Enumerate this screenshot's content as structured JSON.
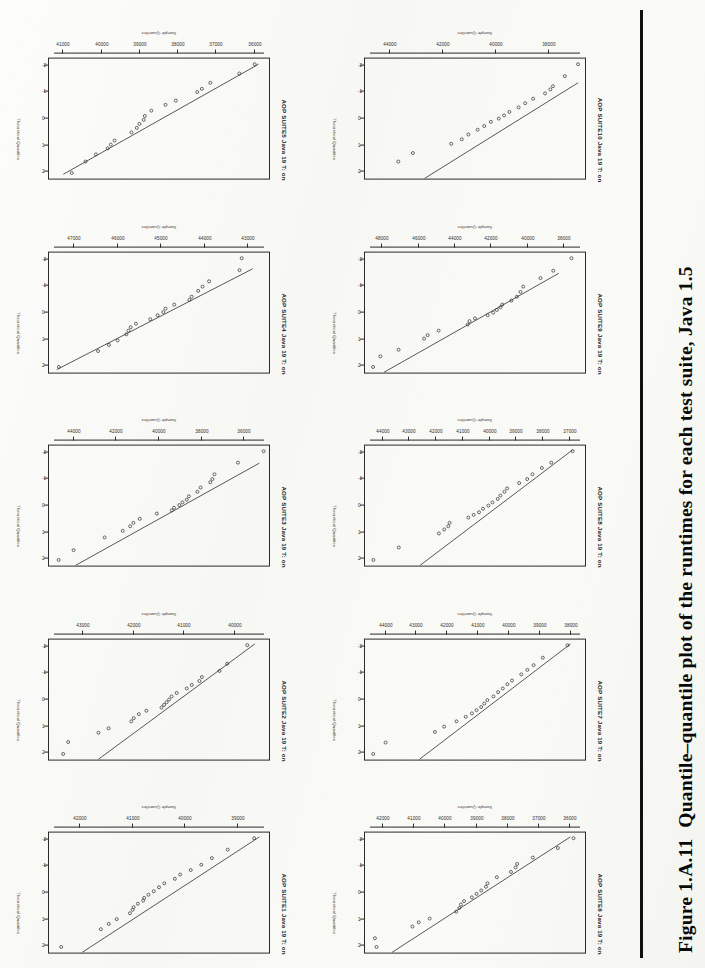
{
  "document": {
    "type": "scanned-book-figure-page",
    "orientation": "rotated-90",
    "caption_label": "Figure 1.A.11",
    "caption_text": "Quantile–quantile plot of the runtimes for each test suite, Java 1.5"
  },
  "axes": {
    "x_label": "Sample Quantiles",
    "y_label": "Theoretical Quantiles",
    "y_ticks": [
      "2",
      "1",
      "0",
      "-1",
      "-2"
    ],
    "y_values": [
      2,
      1,
      0,
      -1,
      -2
    ],
    "ylim": [
      -2.3,
      2.3
    ]
  },
  "chart_data": [
    {
      "type": "scatter",
      "title": "AOP SUITE5 Java 19 T: on",
      "xlabel": "Sample Quantiles",
      "ylabel": "Theoretical Quantiles",
      "xticks": [
        "41000",
        "40000",
        "39000",
        "38000",
        "37000",
        "36000"
      ],
      "xlim": [
        35600,
        41400
      ],
      "ylim": [
        -2.3,
        2.3
      ],
      "grid": false,
      "refline": {
        "x1": 41000,
        "y1": 2.1,
        "x2": 35900,
        "y2": -2.05
      },
      "points": [
        {
          "x": 40780,
          "y": 2.05
        },
        {
          "x": 40420,
          "y": 1.62
        },
        {
          "x": 40150,
          "y": 1.35
        },
        {
          "x": 39840,
          "y": 1.12
        },
        {
          "x": 39760,
          "y": 0.98
        },
        {
          "x": 39660,
          "y": 0.83
        },
        {
          "x": 39220,
          "y": 0.52
        },
        {
          "x": 39080,
          "y": 0.35
        },
        {
          "x": 39010,
          "y": 0.2
        },
        {
          "x": 38900,
          "y": 0.05
        },
        {
          "x": 38870,
          "y": -0.1
        },
        {
          "x": 38700,
          "y": -0.3
        },
        {
          "x": 38330,
          "y": -0.52
        },
        {
          "x": 38060,
          "y": -0.68
        },
        {
          "x": 37500,
          "y": -1.0
        },
        {
          "x": 37380,
          "y": -1.12
        },
        {
          "x": 37160,
          "y": -1.35
        },
        {
          "x": 36400,
          "y": -1.7
        },
        {
          "x": 36000,
          "y": -2.05
        }
      ]
    },
    {
      "type": "scatter",
      "title": "AOP SUITE10 Java 19 T: on",
      "xlabel": "Sample Quantiles",
      "ylabel": "Theoretical Quantiles",
      "xticks": [
        "44000",
        "42000",
        "40000",
        "38000"
      ],
      "xlim": [
        36600,
        45000
      ],
      "ylim": [
        -2.3,
        2.3
      ],
      "grid": false,
      "refline": {
        "x1": 42700,
        "y1": 2.25,
        "x2": 36900,
        "y2": -1.35
      },
      "points": [
        {
          "x": 43700,
          "y": 1.62
        },
        {
          "x": 43150,
          "y": 1.3
        },
        {
          "x": 41700,
          "y": 0.95
        },
        {
          "x": 41300,
          "y": 0.78
        },
        {
          "x": 41050,
          "y": 0.6
        },
        {
          "x": 40700,
          "y": 0.42
        },
        {
          "x": 40450,
          "y": 0.28
        },
        {
          "x": 40200,
          "y": 0.12
        },
        {
          "x": 39900,
          "y": 0.0
        },
        {
          "x": 39700,
          "y": -0.12
        },
        {
          "x": 39500,
          "y": -0.25
        },
        {
          "x": 39150,
          "y": -0.42
        },
        {
          "x": 38900,
          "y": -0.58
        },
        {
          "x": 38600,
          "y": -0.75
        },
        {
          "x": 38150,
          "y": -0.95
        },
        {
          "x": 37950,
          "y": -1.1
        },
        {
          "x": 37850,
          "y": -1.22
        },
        {
          "x": 37400,
          "y": -1.6
        },
        {
          "x": 36900,
          "y": -2.05
        }
      ]
    },
    {
      "type": "scatter",
      "title": "AOP SUITE4 Java 19 T: on",
      "xlabel": "Sample Quantiles",
      "ylabel": "Theoretical Quantiles",
      "xticks": [
        "47000",
        "46000",
        "45000",
        "44000",
        "43000"
      ],
      "xlim": [
        42500,
        47600
      ],
      "ylim": [
        -2.3,
        2.3
      ],
      "grid": false,
      "refline": {
        "x1": 47400,
        "y1": 2.15,
        "x2": 42900,
        "y2": -1.65
      },
      "points": [
        {
          "x": 47350,
          "y": 2.05
        },
        {
          "x": 46450,
          "y": 1.45
        },
        {
          "x": 46200,
          "y": 1.22
        },
        {
          "x": 46000,
          "y": 1.05
        },
        {
          "x": 45800,
          "y": 0.82
        },
        {
          "x": 45750,
          "y": 0.68
        },
        {
          "x": 45700,
          "y": 0.55
        },
        {
          "x": 45580,
          "y": 0.42
        },
        {
          "x": 45250,
          "y": 0.25
        },
        {
          "x": 45080,
          "y": 0.1
        },
        {
          "x": 44950,
          "y": -0.02
        },
        {
          "x": 44900,
          "y": -0.15
        },
        {
          "x": 44700,
          "y": -0.3
        },
        {
          "x": 44350,
          "y": -0.48
        },
        {
          "x": 44300,
          "y": -0.6
        },
        {
          "x": 44150,
          "y": -0.82
        },
        {
          "x": 44050,
          "y": -0.98
        },
        {
          "x": 43900,
          "y": -1.18
        },
        {
          "x": 43200,
          "y": -1.6
        },
        {
          "x": 43150,
          "y": -2.05
        }
      ]
    },
    {
      "type": "scatter",
      "title": "AOP SUITE9 Java 19 T: on",
      "xlabel": "Sample Quantiles",
      "ylabel": "Theoretical Quantiles",
      "xticks": [
        "48000",
        "46000",
        "44000",
        "42000",
        "40000",
        "38000"
      ],
      "xlim": [
        36800,
        49000
      ],
      "ylim": [
        -2.3,
        2.3
      ],
      "grid": false,
      "refline": {
        "x1": 47900,
        "y1": 2.25,
        "x2": 38300,
        "y2": -1.48
      },
      "points": [
        {
          "x": 48500,
          "y": 2.05
        },
        {
          "x": 48100,
          "y": 1.65
        },
        {
          "x": 47100,
          "y": 1.4
        },
        {
          "x": 45700,
          "y": 0.98
        },
        {
          "x": 45500,
          "y": 0.85
        },
        {
          "x": 44900,
          "y": 0.68
        },
        {
          "x": 43300,
          "y": 0.45
        },
        {
          "x": 43200,
          "y": 0.32
        },
        {
          "x": 42900,
          "y": 0.22
        },
        {
          "x": 42200,
          "y": 0.1
        },
        {
          "x": 41900,
          "y": 0.0
        },
        {
          "x": 41700,
          "y": -0.1
        },
        {
          "x": 41500,
          "y": -0.2
        },
        {
          "x": 41400,
          "y": -0.3
        },
        {
          "x": 40900,
          "y": -0.45
        },
        {
          "x": 40600,
          "y": -0.6
        },
        {
          "x": 40400,
          "y": -0.78
        },
        {
          "x": 40250,
          "y": -0.98
        },
        {
          "x": 39300,
          "y": -1.3
        },
        {
          "x": 38600,
          "y": -1.58
        },
        {
          "x": 37600,
          "y": -2.05
        }
      ]
    },
    {
      "type": "scatter",
      "title": "AOP SUITE3 Java 19 T: on",
      "xlabel": "Sample Quantiles",
      "ylabel": "Theoretical Quantiles",
      "xticks": [
        "44000",
        "42000",
        "40000",
        "38000",
        "36000"
      ],
      "xlim": [
        34800,
        45200
      ],
      "ylim": [
        -2.3,
        2.3
      ],
      "grid": false,
      "refline": {
        "x1": 43900,
        "y1": 2.25,
        "x2": 35300,
        "y2": -1.6
      },
      "points": [
        {
          "x": 44700,
          "y": 2.05
        },
        {
          "x": 44000,
          "y": 1.68
        },
        {
          "x": 42550,
          "y": 1.2
        },
        {
          "x": 41700,
          "y": 0.95
        },
        {
          "x": 41350,
          "y": 0.78
        },
        {
          "x": 41200,
          "y": 0.65
        },
        {
          "x": 40900,
          "y": 0.5
        },
        {
          "x": 40100,
          "y": 0.3
        },
        {
          "x": 39400,
          "y": 0.18
        },
        {
          "x": 39300,
          "y": 0.08
        },
        {
          "x": 39050,
          "y": -0.02
        },
        {
          "x": 38900,
          "y": -0.12
        },
        {
          "x": 38700,
          "y": -0.22
        },
        {
          "x": 38600,
          "y": -0.35
        },
        {
          "x": 38200,
          "y": -0.52
        },
        {
          "x": 38050,
          "y": -0.68
        },
        {
          "x": 37600,
          "y": -0.88
        },
        {
          "x": 37500,
          "y": -1.0
        },
        {
          "x": 37400,
          "y": -1.18
        },
        {
          "x": 36300,
          "y": -1.62
        },
        {
          "x": 35100,
          "y": -2.05
        }
      ]
    },
    {
      "type": "scatter",
      "title": "AOP SUITE8 Java 19 T: on",
      "xlabel": "Sample Quantiles",
      "ylabel": "Theoretical Quantiles",
      "xticks": [
        "44000",
        "43000",
        "42000",
        "41000",
        "40000",
        "39000",
        "38000",
        "37000"
      ],
      "xlim": [
        36400,
        44700
      ],
      "ylim": [
        -2.3,
        2.3
      ],
      "grid": false,
      "refline": {
        "x1": 42600,
        "y1": 2.25,
        "x2": 36900,
        "y2": -2.1
      },
      "points": [
        {
          "x": 44350,
          "y": 2.05
        },
        {
          "x": 43400,
          "y": 1.58
        },
        {
          "x": 41900,
          "y": 1.05
        },
        {
          "x": 41700,
          "y": 0.9
        },
        {
          "x": 41550,
          "y": 0.78
        },
        {
          "x": 41500,
          "y": 0.65
        },
        {
          "x": 40800,
          "y": 0.45
        },
        {
          "x": 40600,
          "y": 0.35
        },
        {
          "x": 40400,
          "y": 0.25
        },
        {
          "x": 40250,
          "y": 0.12
        },
        {
          "x": 40050,
          "y": 0.0
        },
        {
          "x": 39900,
          "y": -0.12
        },
        {
          "x": 39700,
          "y": -0.25
        },
        {
          "x": 39600,
          "y": -0.38
        },
        {
          "x": 39450,
          "y": -0.52
        },
        {
          "x": 39350,
          "y": -0.65
        },
        {
          "x": 38900,
          "y": -0.85
        },
        {
          "x": 38600,
          "y": -1.0
        },
        {
          "x": 38400,
          "y": -1.18
        },
        {
          "x": 38050,
          "y": -1.42
        },
        {
          "x": 37700,
          "y": -1.62
        },
        {
          "x": 36900,
          "y": -2.05
        }
      ]
    },
    {
      "type": "scatter",
      "title": "AOP SUITE2 Java 19 T: on",
      "xlabel": "Sample Quantiles",
      "ylabel": "Theoretical Quantiles",
      "xticks": [
        "43000",
        "42000",
        "41000",
        "40000"
      ],
      "xlim": [
        39300,
        43700
      ],
      "ylim": [
        -2.3,
        2.3
      ],
      "grid": false,
      "refline": {
        "x1": 42700,
        "y1": 2.25,
        "x2": 39600,
        "y2": -2.1
      },
      "points": [
        {
          "x": 43400,
          "y": 2.05
        },
        {
          "x": 43300,
          "y": 1.6
        },
        {
          "x": 42700,
          "y": 1.25
        },
        {
          "x": 42500,
          "y": 1.08
        },
        {
          "x": 42050,
          "y": 0.82
        },
        {
          "x": 42000,
          "y": 0.7
        },
        {
          "x": 41900,
          "y": 0.55
        },
        {
          "x": 41750,
          "y": 0.42
        },
        {
          "x": 41450,
          "y": 0.3
        },
        {
          "x": 41400,
          "y": 0.2
        },
        {
          "x": 41350,
          "y": 0.1
        },
        {
          "x": 41300,
          "y": 0.0
        },
        {
          "x": 41250,
          "y": -0.12
        },
        {
          "x": 41150,
          "y": -0.25
        },
        {
          "x": 40950,
          "y": -0.42
        },
        {
          "x": 40850,
          "y": -0.55
        },
        {
          "x": 40700,
          "y": -0.7
        },
        {
          "x": 40650,
          "y": -0.85
        },
        {
          "x": 40300,
          "y": -1.08
        },
        {
          "x": 40150,
          "y": -1.35
        },
        {
          "x": 39750,
          "y": -2.05
        }
      ]
    },
    {
      "type": "scatter",
      "title": "AOP SUITE7 Java 19 T: on",
      "xlabel": "Sample Quantiles",
      "ylabel": "Theoretical Quantiles",
      "xticks": [
        "44000",
        "43000",
        "42000",
        "41000",
        "40000",
        "39000",
        "38000"
      ],
      "xlim": [
        37500,
        44700
      ],
      "ylim": [
        -2.3,
        2.3
      ],
      "grid": false,
      "refline": {
        "x1": 42900,
        "y1": 2.25,
        "x2": 38000,
        "y2": -2.1
      },
      "points": [
        {
          "x": 44400,
          "y": 2.05
        },
        {
          "x": 44000,
          "y": 1.62
        },
        {
          "x": 42400,
          "y": 1.22
        },
        {
          "x": 42100,
          "y": 1.02
        },
        {
          "x": 41700,
          "y": 0.82
        },
        {
          "x": 41400,
          "y": 0.65
        },
        {
          "x": 41200,
          "y": 0.52
        },
        {
          "x": 41050,
          "y": 0.4
        },
        {
          "x": 40900,
          "y": 0.28
        },
        {
          "x": 40800,
          "y": 0.15
        },
        {
          "x": 40700,
          "y": 0.02
        },
        {
          "x": 40500,
          "y": -0.12
        },
        {
          "x": 40350,
          "y": -0.28
        },
        {
          "x": 40200,
          "y": -0.42
        },
        {
          "x": 40050,
          "y": -0.58
        },
        {
          "x": 39900,
          "y": -0.72
        },
        {
          "x": 39600,
          "y": -0.95
        },
        {
          "x": 39400,
          "y": -1.12
        },
        {
          "x": 39200,
          "y": -1.3
        },
        {
          "x": 38900,
          "y": -1.58
        },
        {
          "x": 38100,
          "y": -2.05
        }
      ]
    },
    {
      "type": "scatter",
      "title": "AOP SUITE1 Java 19 T: on",
      "xlabel": "Sample Quantiles",
      "ylabel": "Theoretical Quantiles",
      "xticks": [
        "42000",
        "41000",
        "40000",
        "39000"
      ],
      "xlim": [
        38400,
        42600
      ],
      "ylim": [
        -2.3,
        2.3
      ],
      "grid": false,
      "refline": {
        "x1": 41950,
        "y1": 2.25,
        "x2": 38600,
        "y2": -2.1
      },
      "points": [
        {
          "x": 42350,
          "y": 2.05
        },
        {
          "x": 41600,
          "y": 1.38
        },
        {
          "x": 41450,
          "y": 1.18
        },
        {
          "x": 41300,
          "y": 1.0
        },
        {
          "x": 41050,
          "y": 0.78
        },
        {
          "x": 41000,
          "y": 0.65
        },
        {
          "x": 40980,
          "y": 0.55
        },
        {
          "x": 40900,
          "y": 0.42
        },
        {
          "x": 40800,
          "y": 0.3
        },
        {
          "x": 40780,
          "y": 0.2
        },
        {
          "x": 40700,
          "y": 0.08
        },
        {
          "x": 40600,
          "y": -0.05
        },
        {
          "x": 40500,
          "y": -0.2
        },
        {
          "x": 40400,
          "y": -0.35
        },
        {
          "x": 40200,
          "y": -0.52
        },
        {
          "x": 40100,
          "y": -0.68
        },
        {
          "x": 39900,
          "y": -0.85
        },
        {
          "x": 39700,
          "y": -1.05
        },
        {
          "x": 39500,
          "y": -1.3
        },
        {
          "x": 39200,
          "y": -1.62
        },
        {
          "x": 38700,
          "y": -2.05
        }
      ]
    },
    {
      "type": "scatter",
      "title": "AOP SUITE6 Java 19 T: on",
      "xlabel": "Sample Quantiles",
      "ylabel": "Theoretical Quantiles",
      "xticks": [
        "42000",
        "41000",
        "40000",
        "39000",
        "38000",
        "37000",
        "36000"
      ],
      "xlim": [
        35500,
        42600
      ],
      "ylim": [
        -2.3,
        2.3
      ],
      "grid": false,
      "refline": {
        "x1": 41700,
        "y1": 2.25,
        "x2": 36000,
        "y2": -2.1
      },
      "points": [
        {
          "x": 42200,
          "y": 2.05
        },
        {
          "x": 42250,
          "y": 1.72
        },
        {
          "x": 41050,
          "y": 1.28
        },
        {
          "x": 40850,
          "y": 1.12
        },
        {
          "x": 40500,
          "y": 0.98
        },
        {
          "x": 39650,
          "y": 0.72
        },
        {
          "x": 39550,
          "y": 0.58
        },
        {
          "x": 39500,
          "y": 0.45
        },
        {
          "x": 39400,
          "y": 0.32
        },
        {
          "x": 39150,
          "y": 0.18
        },
        {
          "x": 39000,
          "y": 0.05
        },
        {
          "x": 38850,
          "y": -0.08
        },
        {
          "x": 38700,
          "y": -0.22
        },
        {
          "x": 38650,
          "y": -0.35
        },
        {
          "x": 38350,
          "y": -0.58
        },
        {
          "x": 37900,
          "y": -0.78
        },
        {
          "x": 37750,
          "y": -0.95
        },
        {
          "x": 37700,
          "y": -1.08
        },
        {
          "x": 37200,
          "y": -1.32
        },
        {
          "x": 36400,
          "y": -1.68
        },
        {
          "x": 35900,
          "y": -2.05
        }
      ]
    }
  ]
}
